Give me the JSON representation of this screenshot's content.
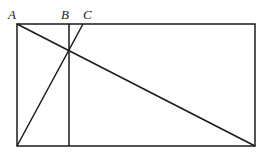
{
  "diagram": {
    "labels": {
      "A": "A",
      "B": "B",
      "C": "C"
    },
    "stroke_color": "#1a1a1a",
    "points": {
      "A": [
        17,
        24
      ],
      "B": [
        69,
        24
      ],
      "C": [
        83,
        24
      ],
      "bottom_left": [
        17,
        146
      ],
      "bottom_right": [
        255,
        146
      ],
      "top_right": [
        255,
        24
      ]
    }
  }
}
